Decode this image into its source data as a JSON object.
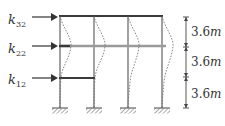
{
  "figure": {
    "type": "three-story four-column frame with mode-shape deflection",
    "colors": {
      "frame": "#6e6e6e",
      "beam_dark": "#3a3a3a",
      "beam_gray": "#9a9a9a",
      "deflection": "#6a6a6a",
      "text": "#333333"
    }
  },
  "stiffness_labels": [
    {
      "symbol": "k",
      "subscript": "32",
      "y": 20
    },
    {
      "symbol": "k",
      "subscript": "22",
      "y": 50
    },
    {
      "symbol": "k",
      "subscript": "12",
      "y": 81
    }
  ],
  "dimensions": [
    {
      "value": "3.6",
      "unit": "m"
    },
    {
      "value": "3.6",
      "unit": "m"
    },
    {
      "value": "3.6",
      "unit": "m"
    }
  ]
}
